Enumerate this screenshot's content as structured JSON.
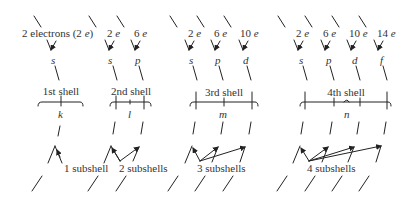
{
  "colors": {
    "ink": "#222222",
    "text": "#333333",
    "background": "#ffffff"
  },
  "groups": [
    {
      "id": "shell-1",
      "electron_labels": [
        {
          "text": "2 electrons (2 ",
          "unit": "e",
          "suffix": ")",
          "x": 22,
          "y": 28
        }
      ],
      "subshell_letters": [
        {
          "text": "s",
          "x": 52,
          "y": 56
        }
      ],
      "shell_label": {
        "text": "1st shell",
        "x": 61,
        "y": 91
      },
      "quantum_letter": {
        "text": "k",
        "x": 61,
        "y": 111
      },
      "count_label": {
        "text": "1 subshell",
        "x": 64,
        "y": 166
      }
    },
    {
      "id": "shell-2",
      "electron_labels": [
        {
          "text": "2 ",
          "unit": "e",
          "x": 107,
          "y": 28
        },
        {
          "text": "6 ",
          "unit": "e",
          "x": 134,
          "y": 28
        }
      ],
      "subshell_letters": [
        {
          "text": "s",
          "x": 110,
          "y": 56
        },
        {
          "text": "p",
          "x": 136,
          "y": 56
        }
      ],
      "shell_label": {
        "text": "2nd shell",
        "x": 133,
        "y": 91
      },
      "quantum_letter": {
        "text": "l",
        "x": 129,
        "y": 111
      },
      "count_label": {
        "text": "2 subshells",
        "x": 119,
        "y": 166
      }
    },
    {
      "id": "shell-3",
      "electron_labels": [
        {
          "text": "2 ",
          "unit": "e",
          "x": 188,
          "y": 28
        },
        {
          "text": "6 ",
          "unit": "e",
          "x": 214,
          "y": 28
        },
        {
          "text": "10 ",
          "unit": "e",
          "x": 240,
          "y": 28
        }
      ],
      "subshell_letters": [
        {
          "text": "s",
          "x": 190,
          "y": 56
        },
        {
          "text": "p",
          "x": 216,
          "y": 56
        },
        {
          "text": "d",
          "x": 244,
          "y": 56
        }
      ],
      "shell_label": {
        "text": "3rd shell",
        "x": 223,
        "y": 91
      },
      "quantum_letter": {
        "text": "m",
        "x": 222,
        "y": 111
      },
      "count_label": {
        "text": "3 subshells",
        "x": 197,
        "y": 166
      }
    },
    {
      "id": "shell-4",
      "electron_labels": [
        {
          "text": "2 ",
          "unit": "e",
          "x": 296,
          "y": 28
        },
        {
          "text": "6 ",
          "unit": "e",
          "x": 323,
          "y": 28
        },
        {
          "text": "10 ",
          "unit": "e",
          "x": 349,
          "y": 28
        },
        {
          "text": "14 ",
          "unit": "e",
          "x": 377,
          "y": 28
        }
      ],
      "subshell_letters": [
        {
          "text": "s",
          "x": 300,
          "y": 56
        },
        {
          "text": "p",
          "x": 327,
          "y": 56
        },
        {
          "text": "d",
          "x": 353,
          "y": 56
        },
        {
          "text": "f",
          "x": 380,
          "y": 56
        }
      ],
      "shell_label": {
        "text": "4th shell",
        "x": 352,
        "y": 91
      },
      "quantum_letter": {
        "text": "n",
        "x": 347,
        "y": 111
      },
      "count_label": {
        "text": "4 subshells",
        "x": 307,
        "y": 166
      }
    }
  ]
}
